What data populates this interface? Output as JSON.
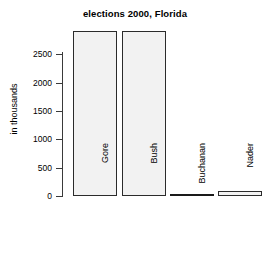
{
  "chart_data": {
    "type": "bar",
    "title": "elections 2000, Florida",
    "xlabel": "",
    "ylabel": "in thousands",
    "categories": [
      "Gore",
      "Bush",
      "Buchanan",
      "Nader"
    ],
    "values": [
      2912,
      2913,
      17,
      97
    ],
    "ylim": [
      0,
      2900
    ],
    "yticks": [
      0,
      500,
      1000,
      1500,
      2000,
      2500
    ],
    "ytick_labels": [
      "0",
      "500",
      "1000",
      "1500",
      "2000",
      "2500"
    ],
    "grid": false,
    "legend": null,
    "bar_fill_color": "#f2f2f2",
    "bar_border_color": "#2b2b2b",
    "axis_color": "#3a3a3a",
    "background_color": "#ffffff"
  }
}
